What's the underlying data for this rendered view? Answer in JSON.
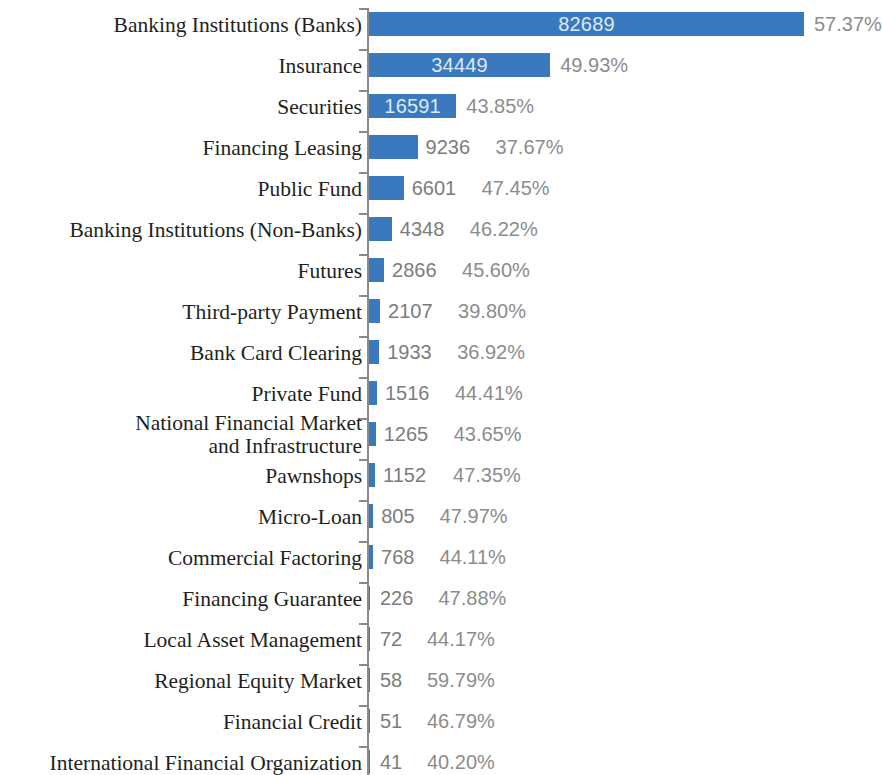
{
  "chart_data": {
    "type": "bar",
    "orientation": "horizontal",
    "title": "",
    "subtitle": "",
    "xlabel": "",
    "ylabel": "",
    "grid": false,
    "legend": null,
    "axis_range": [
      0,
      82689
    ],
    "bar_color": "#3b79be",
    "value_label_color_inside": "#dce9f6",
    "value_label_color_outside": "#7c7c7c",
    "percent_label_color": "#8c8c8c",
    "axis_color": "#8a8a8a",
    "category_label_color": "#231f20",
    "categories": [
      "Banking Institutions (Banks)",
      "Insurance",
      "Securities",
      "Financing Leasing",
      "Public Fund",
      "Banking Institutions (Non-Banks)",
      "Futures",
      "Third-party Payment",
      "Bank Card Clearing",
      "Private Fund",
      "National Financial Market\nand Infrastructure",
      "Pawnshops",
      "Micro-Loan",
      "Commercial Factoring",
      "Financing Guarantee",
      "Local Asset Management",
      "Regional Equity Market",
      "Financial Credit",
      "International Financial Organization"
    ],
    "values": [
      82689,
      34449,
      16591,
      9236,
      6601,
      4348,
      2866,
      2107,
      1933,
      1516,
      1265,
      1152,
      805,
      768,
      226,
      72,
      58,
      51,
      41
    ],
    "value_labels": [
      "82689",
      "34449",
      "16591",
      "9236",
      "6601",
      "4348",
      "2866",
      "2107",
      "1933",
      "1516",
      "1265",
      "1152",
      "805",
      "768",
      "226",
      "72",
      "58",
      "51",
      "41"
    ],
    "percent_labels": [
      "57.37%",
      "49.93%",
      "43.85%",
      "37.67%",
      "47.45%",
      "46.22%",
      "45.60%",
      "39.80%",
      "36.92%",
      "44.41%",
      "47.35%",
      "44.11%",
      "47.97%",
      "44.17%",
      "47.88%",
      "44.17%",
      "59.79%",
      "46.79%",
      "40.20%"
    ],
    "percents": [
      57.37,
      49.93,
      43.85,
      37.67,
      47.45,
      46.22,
      45.6,
      39.8,
      36.92,
      44.41,
      43.65,
      47.35,
      47.97,
      44.11,
      47.88,
      44.17,
      59.79,
      46.79,
      40.2
    ]
  },
  "rows": [
    {
      "label": "Banking Institutions (Banks)",
      "value": "82689",
      "percent": "57.37%",
      "num": 82689
    },
    {
      "label": "Insurance",
      "value": "34449",
      "percent": "49.93%",
      "num": 34449
    },
    {
      "label": "Securities",
      "value": "16591",
      "percent": "43.85%",
      "num": 16591
    },
    {
      "label": "Financing Leasing",
      "value": "9236",
      "percent": "37.67%",
      "num": 9236
    },
    {
      "label": "Public Fund",
      "value": "6601",
      "percent": "47.45%",
      "num": 6601
    },
    {
      "label": "Banking Institutions (Non-Banks)",
      "value": "4348",
      "percent": "46.22%",
      "num": 4348
    },
    {
      "label": "Futures",
      "value": "2866",
      "percent": "45.60%",
      "num": 2866
    },
    {
      "label": "Third-party Payment",
      "value": "2107",
      "percent": "39.80%",
      "num": 2107
    },
    {
      "label": "Bank Card Clearing",
      "value": "1933",
      "percent": "36.92%",
      "num": 1933
    },
    {
      "label": "Private Fund",
      "value": "1516",
      "percent": "44.41%",
      "num": 1516
    },
    {
      "label": "National Financial Market\nand Infrastructure",
      "value": "1265",
      "percent": "43.65%",
      "num": 1265
    },
    {
      "label": "Pawnshops",
      "value": "1152",
      "percent": "47.35%",
      "num": 1152
    },
    {
      "label": "Micro-Loan",
      "value": "805",
      "percent": "47.97%",
      "num": 805
    },
    {
      "label": "Commercial Factoring",
      "value": "768",
      "percent": "44.11%",
      "num": 768
    },
    {
      "label": "Financing Guarantee",
      "value": "226",
      "percent": "47.88%",
      "num": 226
    },
    {
      "label": "Local Asset Management",
      "value": "72",
      "percent": "44.17%",
      "num": 72
    },
    {
      "label": "Regional Equity Market",
      "value": "58",
      "percent": "59.79%",
      "num": 58
    },
    {
      "label": "Financial Credit",
      "value": "51",
      "percent": "46.79%",
      "num": 51
    },
    {
      "label": "International Financial Organization",
      "value": "41",
      "percent": "40.20%",
      "num": 41
    }
  ]
}
